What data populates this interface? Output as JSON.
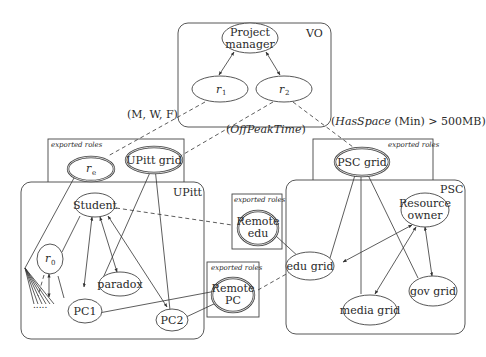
{
  "containers": {
    "vo": {
      "label": "VO"
    },
    "upitt": {
      "label": "UPitt"
    },
    "psc": {
      "label": "PSC"
    }
  },
  "exported_boxes": {
    "upitt_export": {
      "label": "exported roles"
    },
    "psc_export": {
      "label": "exported roles"
    },
    "remote_edu_export": {
      "label": "exported roles"
    },
    "remote_pc_export": {
      "label": "exported roles"
    }
  },
  "nodes": {
    "project_manager": {
      "line1": "Project",
      "line2": "manager"
    },
    "r1": {
      "base": "r",
      "sub": "1"
    },
    "r2": {
      "base": "r",
      "sub": "2"
    },
    "re": {
      "base": "r",
      "sub": "e"
    },
    "upitt_grid": {
      "label": "UPitt grid"
    },
    "psc_grid": {
      "label": "PSC grid"
    },
    "student": {
      "label": "Student"
    },
    "r0": {
      "base": "r",
      "sub": "0"
    },
    "paradox": {
      "label": "paradox"
    },
    "pc1": {
      "label": "PC1"
    },
    "pc2": {
      "label": "PC2"
    },
    "remote_edu": {
      "line1": "Remote",
      "line2": "edu"
    },
    "remote_pc": {
      "line1": "Remote",
      "line2": "PC"
    },
    "edu_grid": {
      "label": "edu grid"
    },
    "resource_owner": {
      "line1": "Resource",
      "line2": "owner"
    },
    "media_grid": {
      "label": "media grid"
    },
    "gov_grid": {
      "label": "gov grid"
    },
    "ellipsis": {
      "label": "....."
    }
  },
  "annotations": {
    "mwf": "(M, W, F)",
    "offpeak_open": "(",
    "offpeak_text": "OffPeakTime",
    "offpeak_close": ")",
    "hasspace_open": "(",
    "hasspace_fn": "HasSpace",
    "hasspace_rest": " (Min) > 500MB)"
  }
}
